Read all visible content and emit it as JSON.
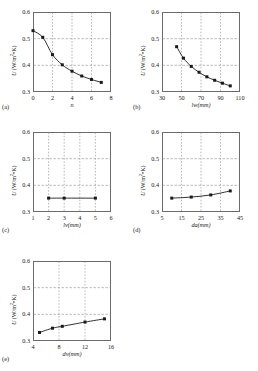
{
  "figure": {
    "axis_color": "#6b6b6b",
    "grid_color": "#8a8a8a",
    "line_color": "#1a1a1a",
    "marker_color": "#1a1a1a",
    "y_axis_label_prefix": "U",
    "y_axis_label_units": "(W/m",
    "y_axis_label_exp": "2",
    "y_axis_label_suffix": "•K)"
  },
  "panels": [
    {
      "letter": "(a)",
      "xlabel": "n",
      "ylabel": "U (W/m2•K)",
      "xticks": [
        "0",
        "2",
        "4",
        "6",
        "8"
      ],
      "yticks": [
        "0.3",
        "0.4",
        "0.5",
        "0.6"
      ],
      "xlim": [
        0,
        8
      ],
      "ylim": [
        0.3,
        0.6
      ]
    },
    {
      "letter": "(b)",
      "xlabel": "lw(mm)",
      "ylabel": "U (W/m2•K)",
      "xticks": [
        "30",
        "50",
        "70",
        "90",
        "110"
      ],
      "yticks": [
        "0.3",
        "0.4",
        "0.5",
        "0.6"
      ],
      "xlim": [
        30,
        110
      ],
      "ylim": [
        0.3,
        0.6
      ]
    },
    {
      "letter": "(c)",
      "xlabel": "lv(mm)",
      "ylabel": "U (W/m2•K)",
      "xticks": [
        "1",
        "2",
        "3",
        "4",
        "5",
        "6"
      ],
      "yticks": [
        "0.3",
        "0.4",
        "0.5",
        "0.6"
      ],
      "xlim": [
        1,
        6
      ],
      "ylim": [
        0.3,
        0.6
      ]
    },
    {
      "letter": "(d)",
      "xlabel": "da(mm)",
      "ylabel": "U (W/m2•K)",
      "xticks": [
        "5",
        "15",
        "25",
        "35",
        "45"
      ],
      "yticks": [
        "0.3",
        "0.4",
        "0.5",
        "0.6"
      ],
      "xlim": [
        5,
        45
      ],
      "ylim": [
        0.3,
        0.6
      ]
    },
    {
      "letter": "(e)",
      "xlabel": "dv(mm)",
      "ylabel": "U (W/m2•K)",
      "xticks": [
        "4",
        "8",
        "12",
        "16"
      ],
      "yticks": [
        "0.3",
        "0.4",
        "0.5",
        "0.6"
      ],
      "xlim": [
        4,
        16
      ],
      "ylim": [
        0.3,
        0.6
      ]
    }
  ],
  "chart_data": [
    {
      "type": "line",
      "panel": "(a)",
      "title": "",
      "xlabel": "n",
      "ylabel": "U (W/m2•K)",
      "xlim": [
        0,
        8
      ],
      "ylim": [
        0.3,
        0.6
      ],
      "xticks": [
        0,
        2,
        4,
        6,
        8
      ],
      "yticks": [
        0.3,
        0.4,
        0.5,
        0.6
      ],
      "grid": "dashed-both",
      "legend": "none",
      "x": [
        0,
        1,
        2,
        3,
        4,
        5,
        6,
        7
      ],
      "values": [
        0.53,
        0.505,
        0.44,
        0.402,
        0.378,
        0.36,
        0.347,
        0.336
      ]
    },
    {
      "type": "line",
      "panel": "(b)",
      "title": "",
      "xlabel": "lw(mm)",
      "ylabel": "U (W/m2•K)",
      "xlim": [
        30,
        110
      ],
      "ylim": [
        0.3,
        0.6
      ],
      "xticks": [
        30,
        50,
        70,
        90,
        110
      ],
      "yticks": [
        0.3,
        0.4,
        0.5,
        0.6
      ],
      "grid": "dashed-both",
      "legend": "none",
      "x": [
        45,
        52,
        60,
        68,
        76,
        84,
        92,
        100
      ],
      "values": [
        0.47,
        0.427,
        0.396,
        0.374,
        0.357,
        0.344,
        0.333,
        0.323
      ]
    },
    {
      "type": "line",
      "panel": "(c)",
      "title": "",
      "xlabel": "lv(mm)",
      "ylabel": "U (W/m2•K)",
      "xlim": [
        1,
        6
      ],
      "ylim": [
        0.3,
        0.6
      ],
      "xticks": [
        1,
        2,
        3,
        4,
        5,
        6
      ],
      "yticks": [
        0.3,
        0.4,
        0.5,
        0.6
      ],
      "grid": "dashed-both",
      "legend": "none",
      "x": [
        2,
        3,
        5
      ],
      "values": [
        0.352,
        0.352,
        0.352
      ]
    },
    {
      "type": "line",
      "panel": "(d)",
      "title": "",
      "xlabel": "da(mm)",
      "ylabel": "U (W/m2•K)",
      "xlim": [
        5,
        45
      ],
      "ylim": [
        0.3,
        0.6
      ],
      "xticks": [
        5,
        15,
        25,
        35,
        45
      ],
      "yticks": [
        0.3,
        0.4,
        0.5,
        0.6
      ],
      "grid": "dashed-both",
      "legend": "none",
      "x": [
        10,
        20,
        30,
        40
      ],
      "values": [
        0.352,
        0.356,
        0.364,
        0.379
      ]
    },
    {
      "type": "line",
      "panel": "(e)",
      "title": "",
      "xlabel": "dv(mm)",
      "ylabel": "U (W/m2•K)",
      "xlim": [
        4,
        16
      ],
      "ylim": [
        0.3,
        0.6
      ],
      "xticks": [
        4,
        8,
        12,
        16
      ],
      "yticks": [
        0.3,
        0.4,
        0.5,
        0.6
      ],
      "grid": "dashed-both",
      "legend": "none",
      "x": [
        5,
        7,
        8.5,
        12,
        15
      ],
      "values": [
        0.332,
        0.348,
        0.355,
        0.371,
        0.383
      ]
    }
  ]
}
